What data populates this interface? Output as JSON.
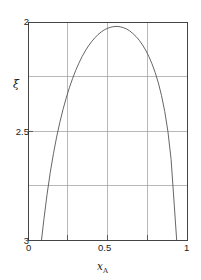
{
  "chart_data": {
    "type": "line",
    "title": "",
    "subtitle": "",
    "xlabel": "x_A",
    "xlabel_base": "x",
    "xlabel_sub": "A",
    "ylabel": "ξ",
    "xlim": [
      0,
      1
    ],
    "ylim": [
      3,
      2
    ],
    "y_inverted": true,
    "grid": true,
    "legend": null,
    "legend_position": "none",
    "xticks": [
      0,
      0.25,
      0.5,
      0.75,
      1
    ],
    "xtick_labels": [
      "0",
      "",
      "0.5",
      "",
      "1"
    ],
    "yticks": [
      2,
      2.25,
      2.5,
      2.75,
      3
    ],
    "ytick_labels": [
      "2",
      "",
      "2.5",
      "",
      "3"
    ],
    "curve_color": "#555555",
    "grid_color": "#999999",
    "frame_color": "#444444",
    "series": [
      {
        "name": "xi vs x_A",
        "x": [
          0.085,
          0.1,
          0.12,
          0.14,
          0.16,
          0.18,
          0.2,
          0.22,
          0.24,
          0.26,
          0.28,
          0.3,
          0.32,
          0.34,
          0.36,
          0.38,
          0.4,
          0.42,
          0.44,
          0.46,
          0.48,
          0.5,
          0.52,
          0.54,
          0.56,
          0.58,
          0.6,
          0.62,
          0.64,
          0.66,
          0.68,
          0.7,
          0.72,
          0.74,
          0.76,
          0.78,
          0.8,
          0.82,
          0.84,
          0.86,
          0.88,
          0.9,
          0.92,
          0.935
        ],
        "y": [
          3.0,
          2.905,
          2.79,
          2.69,
          2.604,
          2.528,
          2.461,
          2.402,
          2.349,
          2.302,
          2.26,
          2.222,
          2.189,
          2.159,
          2.133,
          2.11,
          2.09,
          2.073,
          2.058,
          2.046,
          2.036,
          2.029,
          2.024,
          2.021,
          2.02,
          2.022,
          2.026,
          2.032,
          2.041,
          2.053,
          2.067,
          2.084,
          2.105,
          2.129,
          2.158,
          2.192,
          2.232,
          2.28,
          2.338,
          2.41,
          2.502,
          2.63,
          2.84,
          3.0
        ]
      }
    ],
    "annotations": []
  },
  "axis": {
    "y": {
      "labels": [
        "2",
        "2.5",
        "3"
      ]
    },
    "x": {
      "labels": [
        "0",
        "0.5",
        "1"
      ],
      "title_base": "x",
      "title_sub": "A"
    },
    "ylabel_symbol": "ξ"
  }
}
